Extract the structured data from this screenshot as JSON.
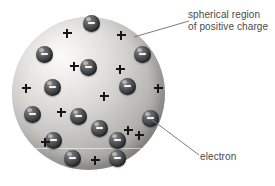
{
  "figure": {
    "kind": "atomic-model-diagram",
    "model_name": "plum pudding model"
  },
  "labels": {
    "positive_region": {
      "line1": "spherical region",
      "line2": "of positive charge"
    },
    "electron": "electron"
  },
  "colors": {
    "sphere_light": "#f7f6f4",
    "sphere_mid": "#c0bfbb",
    "sphere_dark": "#86857f",
    "electron_dark": "#2c2e30",
    "electron_light": "#8f9092",
    "minus_sign": "#f2f2f0",
    "plus_sign": "#16161a",
    "label_text": "#4a4a4a",
    "leader_line": "#7d7d7d",
    "background": "#ffffff"
  },
  "sphere": {
    "cx": 88.5,
    "cy": 93,
    "r": 76.5,
    "equator_y": 148
  },
  "electrons": [
    {
      "x": 91,
      "y": 23
    },
    {
      "x": 142,
      "y": 54
    },
    {
      "x": 44,
      "y": 54
    },
    {
      "x": 88,
      "y": 67
    },
    {
      "x": 127,
      "y": 86
    },
    {
      "x": 52,
      "y": 87
    },
    {
      "x": 32,
      "y": 114
    },
    {
      "x": 78,
      "y": 116
    },
    {
      "x": 150,
      "y": 118
    },
    {
      "x": 99,
      "y": 128
    },
    {
      "x": 53,
      "y": 140
    },
    {
      "x": 117,
      "y": 140
    },
    {
      "x": 72,
      "y": 158
    },
    {
      "x": 117,
      "y": 158
    }
  ],
  "plus_signs": [
    {
      "x": 67,
      "y": 33
    },
    {
      "x": 121,
      "y": 35
    },
    {
      "x": 74,
      "y": 66
    },
    {
      "x": 120,
      "y": 69
    },
    {
      "x": 26,
      "y": 88
    },
    {
      "x": 104,
      "y": 96
    },
    {
      "x": 158,
      "y": 88
    },
    {
      "x": 61,
      "y": 112
    },
    {
      "x": 128,
      "y": 130
    },
    {
      "x": 45,
      "y": 142
    },
    {
      "x": 95,
      "y": 160
    },
    {
      "x": 139,
      "y": 135
    }
  ],
  "leader_lines": [
    {
      "name": "positive-region-leader",
      "x1": 134,
      "y1": 37,
      "x2": 189,
      "y2": 21
    },
    {
      "name": "electron-leader",
      "x1": 151,
      "y1": 119,
      "x2": 199,
      "y2": 155
    }
  ]
}
